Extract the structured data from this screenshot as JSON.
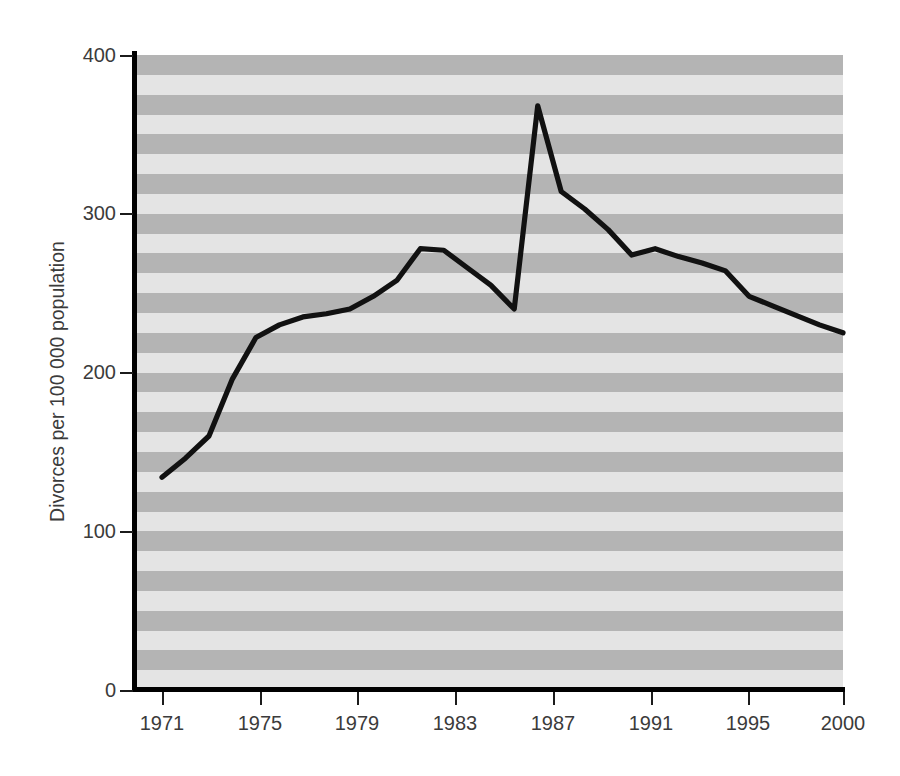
{
  "figure": {
    "top_caption_sliver": "",
    "background_color": "#ffffff",
    "band_light_color": "#e4e4e4",
    "band_dark_color": "#b4b4b4",
    "line_color": "#111111",
    "axis_color": "#000000",
    "text_color": "#3b3b3b"
  },
  "chart_data": {
    "type": "line",
    "title": "",
    "subtitle": "",
    "xlabel": "",
    "ylabel": "Divorces per 100 000 population",
    "xlim": [
      1971,
      2000
    ],
    "ylim": [
      0,
      400
    ],
    "yticks": [
      0,
      100,
      200,
      300,
      400
    ],
    "ytick_labels": [
      "0",
      "100",
      "200",
      "300",
      "400"
    ],
    "xticks": [
      1971,
      1975,
      1979,
      1983,
      1987,
      1991,
      1995,
      2000
    ],
    "xtick_labels": [
      "1971",
      "1975",
      "1979",
      "1983",
      "1987",
      "1991",
      "1995",
      "2000"
    ],
    "grid": "horizontal-banded",
    "legend": null,
    "annotations": [],
    "series": [
      {
        "name": "Divorces per 100 000 population",
        "color": "#111111",
        "x": [
          1971,
          1972,
          1973,
          1974,
          1975,
          1976,
          1977,
          1978,
          1979,
          1980,
          1981,
          1982,
          1983,
          1984,
          1985,
          1986,
          1987,
          1988,
          1989,
          1990,
          1991,
          1992,
          1993,
          1994,
          1995,
          1996,
          1997,
          1998,
          1999,
          2000
        ],
        "values": [
          134,
          146,
          160,
          196,
          222,
          230,
          235,
          237,
          240,
          248,
          258,
          278,
          277,
          266,
          255,
          240,
          368,
          314,
          303,
          290,
          274,
          278,
          273,
          269,
          264,
          248,
          242,
          236,
          230,
          225
        ]
      }
    ]
  }
}
